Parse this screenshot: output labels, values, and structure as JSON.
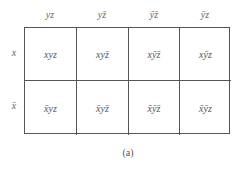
{
  "diagram": {
    "type": "karnaugh-map",
    "variables": [
      "x",
      "y",
      "z"
    ],
    "column_headers": [
      {
        "label": "yz",
        "parts": [
          {
            "t": "y",
            "bar": false
          },
          {
            "t": "z",
            "bar": false
          }
        ]
      },
      {
        "label": "yz̄",
        "parts": [
          {
            "t": "y",
            "bar": false
          },
          {
            "t": "z",
            "bar": true
          }
        ]
      },
      {
        "label": "ȳz̄",
        "parts": [
          {
            "t": "y",
            "bar": true
          },
          {
            "t": "z",
            "bar": true
          }
        ]
      },
      {
        "label": "ȳz",
        "parts": [
          {
            "t": "y",
            "bar": true
          },
          {
            "t": "z",
            "bar": false
          }
        ]
      }
    ],
    "row_labels": [
      {
        "label": "x",
        "parts": [
          {
            "t": "x",
            "bar": false
          }
        ]
      },
      {
        "label": "x̄",
        "parts": [
          {
            "t": "x",
            "bar": true
          }
        ]
      }
    ],
    "cells": [
      [
        {
          "label": "xyz"
        },
        {
          "label": "xyz̄"
        },
        {
          "label": "xȳz̄"
        },
        {
          "label": "xȳz"
        }
      ],
      [
        {
          "label": "x̄yz"
        },
        {
          "label": "x̄yz̄"
        },
        {
          "label": "x̄ȳz̄"
        },
        {
          "label": "x̄ȳz"
        }
      ]
    ],
    "caption": "(a)"
  },
  "colors": {
    "line": "#555555",
    "text": "#555555",
    "background": "#ffffff"
  }
}
